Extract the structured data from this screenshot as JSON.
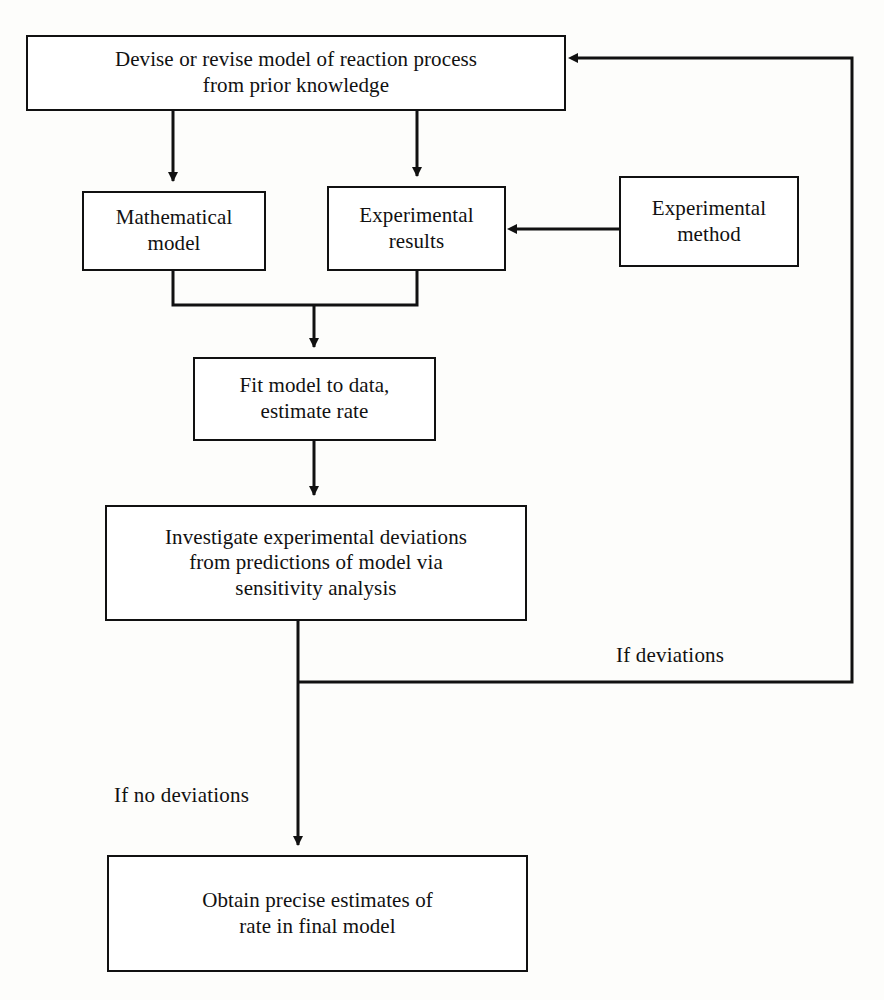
{
  "diagram": {
    "stroke_color": "#111111",
    "background_color": "#fdfdfb",
    "nodes": [
      {
        "id": "devise",
        "label": "Devise or revise model of reaction process\nfrom prior knowledge"
      },
      {
        "id": "math_model",
        "label": "Mathematical\nmodel"
      },
      {
        "id": "exp_results",
        "label": "Experimental\nresults"
      },
      {
        "id": "exp_method",
        "label": "Experimental\nmethod"
      },
      {
        "id": "fit_model",
        "label": "Fit model to data,\nestimate rate"
      },
      {
        "id": "investigate",
        "label": "Investigate experimental deviations\nfrom predictions of model via\nsensitivity analysis"
      },
      {
        "id": "obtain",
        "label": "Obtain precise estimates of\nrate in final model"
      }
    ],
    "edge_labels": [
      {
        "id": "if_deviations",
        "text": "If deviations"
      },
      {
        "id": "if_no_deviations",
        "text": "If no deviations"
      }
    ],
    "connections": [
      {
        "from": "devise",
        "to": "math_model",
        "arrow": true
      },
      {
        "from": "devise",
        "to": "exp_results",
        "arrow": true
      },
      {
        "from": "exp_method",
        "to": "exp_results",
        "arrow": true
      },
      {
        "from": "math_model",
        "to": "fit_model",
        "arrow": true
      },
      {
        "from": "exp_results",
        "to": "fit_model",
        "arrow": true
      },
      {
        "from": "fit_model",
        "to": "investigate",
        "arrow": true
      },
      {
        "from": "investigate",
        "to": "devise",
        "arrow": true,
        "label": "If deviations"
      },
      {
        "from": "investigate",
        "to": "obtain",
        "arrow": true,
        "label": "If no deviations"
      }
    ]
  }
}
